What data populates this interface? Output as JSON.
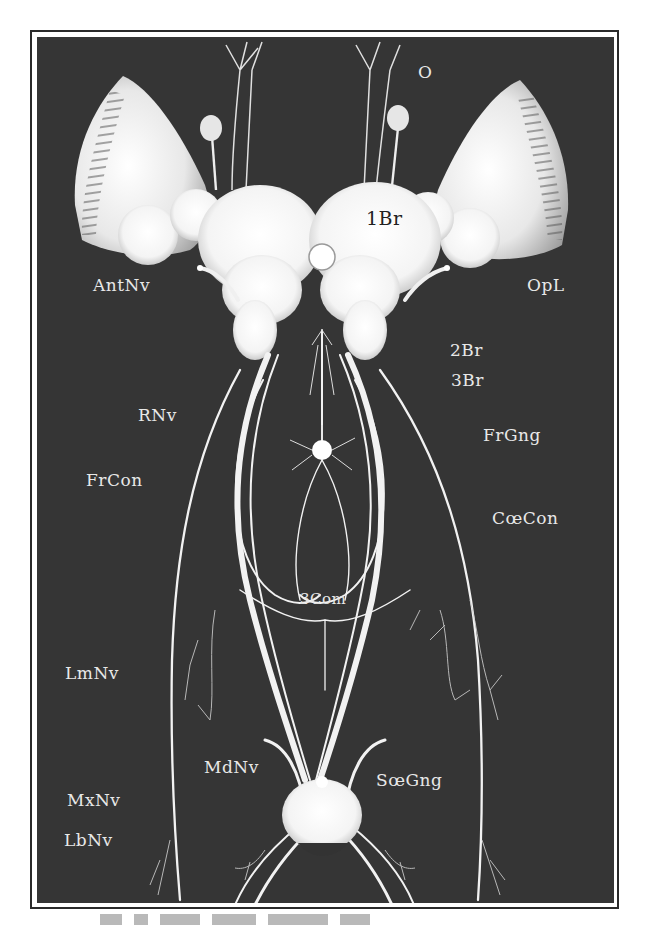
{
  "figure": {
    "type": "anatomical illustration",
    "colors": {
      "plate_background": "#353535",
      "nerve_tissue": "#f2f2f2",
      "label_text": "#e8e8e8",
      "frame": "#2a2a2a"
    },
    "labels": [
      {
        "id": "O",
        "text": "O",
        "x": 418,
        "y": 62
      },
      {
        "id": "1Br",
        "text": "1Br",
        "x": 366,
        "y": 218,
        "on_tissue": true
      },
      {
        "id": "AntNv",
        "text": "AntNv",
        "x": 93,
        "y": 275
      },
      {
        "id": "OpL",
        "text": "OpL",
        "x": 527,
        "y": 275
      },
      {
        "id": "2Br",
        "text": "2Br",
        "x": 450,
        "y": 340
      },
      {
        "id": "3Br",
        "text": "3Br",
        "x": 451,
        "y": 370
      },
      {
        "id": "RNv",
        "text": "RNv",
        "x": 138,
        "y": 405
      },
      {
        "id": "FrGng",
        "text": "FrGng",
        "x": 483,
        "y": 425
      },
      {
        "id": "FrCon",
        "text": "FrCon",
        "x": 86,
        "y": 470
      },
      {
        "id": "CoeCon",
        "text": "CœCon",
        "x": 492,
        "y": 508
      },
      {
        "id": "3Com",
        "text": "3Com",
        "x": 300,
        "y": 590
      },
      {
        "id": "LmNv",
        "text": "LmNv",
        "x": 65,
        "y": 663
      },
      {
        "id": "MdNv",
        "text": "MdNv",
        "x": 204,
        "y": 757
      },
      {
        "id": "SoeGng",
        "text": "SœGng",
        "x": 376,
        "y": 770
      },
      {
        "id": "MxNv",
        "text": "MxNv",
        "x": 67,
        "y": 790
      },
      {
        "id": "LbNv",
        "text": "LbNv",
        "x": 64,
        "y": 830
      }
    ]
  },
  "caption": {
    "visible": "partially cropped at bottom edge; text not legible"
  }
}
